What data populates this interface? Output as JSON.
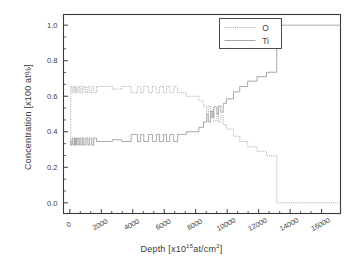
{
  "chart_data": {
    "type": "line",
    "title": "",
    "xlabel_prefix": "Depth [x10",
    "xlabel_exponent": "15",
    "xlabel_suffix": "at/cm",
    "xlabel_suffix_exp": "2",
    "xlabel_close": "]",
    "xlabel_full": "Depth [x10^15 at/cm^2]",
    "ylabel": "Concentration [x100 at%]",
    "xlim": [
      -400,
      17200
    ],
    "ylim": [
      -0.06,
      1.06
    ],
    "xticks": [
      0,
      2000,
      4000,
      6000,
      8000,
      10000,
      12000,
      14000,
      16000
    ],
    "xtick_labels": [
      "0",
      "2000",
      "4000",
      "6000",
      "8000",
      "10000",
      "12000",
      "14000",
      "16000"
    ],
    "yticks": [
      0.0,
      0.2,
      0.4,
      0.6,
      0.8,
      1.0
    ],
    "ytick_labels": [
      "0.0",
      "0.2",
      "0.4",
      "0.6",
      "0.8",
      "1.0"
    ],
    "x_minor_ticks_per_major": 2,
    "y_minor_ticks_per_major": 2,
    "grid": false,
    "legend_position": "top-right",
    "line_color": "#9a9a9a",
    "axis_color": "#3a3a3a",
    "series": [
      {
        "name": "O",
        "style": "dotted",
        "points": [
          [
            0,
            0.33
          ],
          [
            60,
            0.33
          ],
          [
            60,
            0.655
          ],
          [
            140,
            0.655
          ],
          [
            140,
            0.62
          ],
          [
            200,
            0.62
          ],
          [
            200,
            0.655
          ],
          [
            300,
            0.655
          ],
          [
            300,
            0.62
          ],
          [
            360,
            0.62
          ],
          [
            360,
            0.655
          ],
          [
            430,
            0.655
          ],
          [
            430,
            0.62
          ],
          [
            520,
            0.62
          ],
          [
            520,
            0.655
          ],
          [
            600,
            0.655
          ],
          [
            600,
            0.62
          ],
          [
            700,
            0.62
          ],
          [
            700,
            0.655
          ],
          [
            800,
            0.655
          ],
          [
            800,
            0.62
          ],
          [
            900,
            0.62
          ],
          [
            900,
            0.655
          ],
          [
            1020,
            0.655
          ],
          [
            1020,
            0.62
          ],
          [
            1150,
            0.62
          ],
          [
            1150,
            0.655
          ],
          [
            1260,
            0.655
          ],
          [
            1260,
            0.62
          ],
          [
            1400,
            0.62
          ],
          [
            1400,
            0.655
          ],
          [
            1520,
            0.655
          ],
          [
            1520,
            0.62
          ],
          [
            1700,
            0.62
          ],
          [
            1700,
            0.655
          ],
          [
            2700,
            0.655
          ],
          [
            2700,
            0.64
          ],
          [
            3300,
            0.64
          ],
          [
            3300,
            0.655
          ],
          [
            3900,
            0.655
          ],
          [
            3900,
            0.62
          ],
          [
            4300,
            0.62
          ],
          [
            4300,
            0.655
          ],
          [
            4500,
            0.655
          ],
          [
            4500,
            0.62
          ],
          [
            4700,
            0.62
          ],
          [
            4700,
            0.655
          ],
          [
            5000,
            0.655
          ],
          [
            5000,
            0.62
          ],
          [
            5250,
            0.62
          ],
          [
            5250,
            0.655
          ],
          [
            5500,
            0.655
          ],
          [
            5500,
            0.62
          ],
          [
            5700,
            0.62
          ],
          [
            5700,
            0.655
          ],
          [
            5950,
            0.655
          ],
          [
            5950,
            0.62
          ],
          [
            6150,
            0.62
          ],
          [
            6150,
            0.655
          ],
          [
            6350,
            0.655
          ],
          [
            6350,
            0.62
          ],
          [
            6600,
            0.62
          ],
          [
            6600,
            0.655
          ],
          [
            6850,
            0.655
          ],
          [
            6850,
            0.62
          ],
          [
            7400,
            0.62
          ],
          [
            7400,
            0.6
          ],
          [
            8200,
            0.6
          ],
          [
            8200,
            0.575
          ],
          [
            8500,
            0.575
          ],
          [
            8500,
            0.545
          ],
          [
            8700,
            0.545
          ],
          [
            8700,
            0.5
          ],
          [
            8800,
            0.5
          ],
          [
            8800,
            0.545
          ],
          [
            8950,
            0.545
          ],
          [
            8950,
            0.485
          ],
          [
            9050,
            0.485
          ],
          [
            9050,
            0.52
          ],
          [
            9150,
            0.52
          ],
          [
            9150,
            0.46
          ],
          [
            9350,
            0.46
          ],
          [
            9350,
            0.5
          ],
          [
            9450,
            0.5
          ],
          [
            9450,
            0.455
          ],
          [
            9600,
            0.455
          ],
          [
            9600,
            0.49
          ],
          [
            9750,
            0.49
          ],
          [
            9750,
            0.44
          ],
          [
            9950,
            0.44
          ],
          [
            9950,
            0.415
          ],
          [
            10400,
            0.415
          ],
          [
            10400,
            0.375
          ],
          [
            10800,
            0.375
          ],
          [
            10800,
            0.345
          ],
          [
            11300,
            0.345
          ],
          [
            11300,
            0.315
          ],
          [
            11900,
            0.315
          ],
          [
            11900,
            0.29
          ],
          [
            12500,
            0.29
          ],
          [
            12500,
            0.265
          ],
          [
            13150,
            0.265
          ],
          [
            13150,
            0.0
          ],
          [
            17200,
            0.0
          ]
        ]
      },
      {
        "name": "Ti",
        "style": "solid",
        "points": [
          [
            0,
            0.345
          ],
          [
            60,
            0.345
          ],
          [
            60,
            0.325
          ],
          [
            140,
            0.325
          ],
          [
            140,
            0.365
          ],
          [
            200,
            0.365
          ],
          [
            200,
            0.325
          ],
          [
            300,
            0.325
          ],
          [
            300,
            0.365
          ],
          [
            360,
            0.365
          ],
          [
            360,
            0.325
          ],
          [
            430,
            0.325
          ],
          [
            430,
            0.365
          ],
          [
            520,
            0.365
          ],
          [
            520,
            0.325
          ],
          [
            600,
            0.325
          ],
          [
            600,
            0.365
          ],
          [
            700,
            0.365
          ],
          [
            700,
            0.325
          ],
          [
            800,
            0.325
          ],
          [
            800,
            0.365
          ],
          [
            900,
            0.365
          ],
          [
            900,
            0.325
          ],
          [
            1020,
            0.325
          ],
          [
            1020,
            0.365
          ],
          [
            1150,
            0.365
          ],
          [
            1150,
            0.325
          ],
          [
            1260,
            0.325
          ],
          [
            1260,
            0.365
          ],
          [
            1400,
            0.365
          ],
          [
            1400,
            0.325
          ],
          [
            1520,
            0.325
          ],
          [
            1520,
            0.365
          ],
          [
            1700,
            0.365
          ],
          [
            1700,
            0.345
          ],
          [
            2700,
            0.345
          ],
          [
            2700,
            0.355
          ],
          [
            3300,
            0.355
          ],
          [
            3300,
            0.345
          ],
          [
            3900,
            0.345
          ],
          [
            3900,
            0.385
          ],
          [
            4300,
            0.385
          ],
          [
            4300,
            0.345
          ],
          [
            4500,
            0.345
          ],
          [
            4500,
            0.385
          ],
          [
            4700,
            0.385
          ],
          [
            4700,
            0.345
          ],
          [
            5000,
            0.345
          ],
          [
            5000,
            0.385
          ],
          [
            5250,
            0.385
          ],
          [
            5250,
            0.345
          ],
          [
            5500,
            0.345
          ],
          [
            5500,
            0.385
          ],
          [
            5700,
            0.385
          ],
          [
            5700,
            0.345
          ],
          [
            5950,
            0.345
          ],
          [
            5950,
            0.385
          ],
          [
            6150,
            0.385
          ],
          [
            6150,
            0.345
          ],
          [
            6350,
            0.345
          ],
          [
            6350,
            0.385
          ],
          [
            6600,
            0.385
          ],
          [
            6600,
            0.345
          ],
          [
            6850,
            0.345
          ],
          [
            6850,
            0.385
          ],
          [
            7400,
            0.385
          ],
          [
            7400,
            0.4
          ],
          [
            8200,
            0.4
          ],
          [
            8200,
            0.425
          ],
          [
            8500,
            0.425
          ],
          [
            8500,
            0.455
          ],
          [
            8700,
            0.455
          ],
          [
            8700,
            0.5
          ],
          [
            8800,
            0.5
          ],
          [
            8800,
            0.455
          ],
          [
            8950,
            0.455
          ],
          [
            8950,
            0.515
          ],
          [
            9050,
            0.515
          ],
          [
            9050,
            0.48
          ],
          [
            9150,
            0.48
          ],
          [
            9150,
            0.54
          ],
          [
            9350,
            0.54
          ],
          [
            9350,
            0.5
          ],
          [
            9450,
            0.5
          ],
          [
            9450,
            0.545
          ],
          [
            9600,
            0.545
          ],
          [
            9600,
            0.51
          ],
          [
            9750,
            0.51
          ],
          [
            9750,
            0.56
          ],
          [
            9950,
            0.56
          ],
          [
            9950,
            0.585
          ],
          [
            10400,
            0.585
          ],
          [
            10400,
            0.625
          ],
          [
            10800,
            0.625
          ],
          [
            10800,
            0.655
          ],
          [
            11300,
            0.655
          ],
          [
            11300,
            0.685
          ],
          [
            11900,
            0.685
          ],
          [
            11900,
            0.71
          ],
          [
            12500,
            0.71
          ],
          [
            12500,
            0.735
          ],
          [
            13150,
            0.735
          ],
          [
            13150,
            1.0
          ],
          [
            17200,
            1.0
          ]
        ]
      }
    ]
  }
}
